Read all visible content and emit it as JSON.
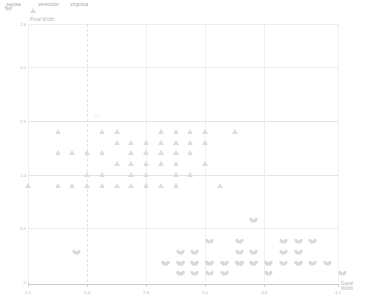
{
  "chart_data": {
    "type": "scatter",
    "title": "",
    "xlabel": "Sepal Width",
    "ylabel": "Petal Width",
    "xlim": [
      2.0,
      4.1
    ],
    "ylim": [
      0,
      2.4
    ],
    "grid": true,
    "legend_position": "top-left",
    "xticks": [
      "2.0",
      "2.4",
      "2.8",
      "3.2",
      "3.6",
      "4.1"
    ],
    "yticks": [
      "0",
      "0.5",
      "1.0",
      "1.5",
      "2.0",
      "2.4"
    ],
    "annotation": "1.5",
    "series": [
      {
        "name": "setosa",
        "marker": "heart-marker",
        "color": "#d8d8e2",
        "points": [
          [
            2.3,
            0.3
          ],
          [
            2.9,
            0.2
          ],
          [
            3.0,
            0.2
          ],
          [
            3.0,
            0.1
          ],
          [
            3.0,
            0.2
          ],
          [
            3.1,
            0.2
          ],
          [
            3.1,
            0.1
          ],
          [
            3.1,
            0.2
          ],
          [
            3.2,
            0.2
          ],
          [
            3.2,
            0.2
          ],
          [
            3.3,
            0.1
          ],
          [
            3.4,
            0.2
          ],
          [
            3.4,
            0.2
          ],
          [
            3.4,
            0.4
          ],
          [
            3.4,
            0.2
          ],
          [
            3.5,
            0.2
          ],
          [
            3.5,
            0.2
          ],
          [
            3.5,
            0.6
          ],
          [
            3.6,
            0.1
          ],
          [
            3.6,
            0.2
          ],
          [
            3.7,
            0.2
          ],
          [
            3.7,
            0.4
          ],
          [
            3.8,
            0.2
          ],
          [
            3.8,
            0.3
          ],
          [
            3.8,
            0.2
          ],
          [
            3.9,
            0.4
          ],
          [
            3.9,
            0.2
          ],
          [
            4.0,
            0.2
          ],
          [
            4.1,
            0.1
          ],
          [
            4.2,
            0.2
          ],
          [
            4.4,
            0.2
          ],
          [
            3.0,
            0.2
          ],
          [
            3.2,
            0.2
          ],
          [
            3.4,
            0.2
          ],
          [
            3.5,
            0.2
          ],
          [
            3.1,
            0.2
          ],
          [
            3.0,
            0.1
          ],
          [
            3.2,
            0.1
          ],
          [
            3.3,
            0.2
          ],
          [
            3.4,
            0.2
          ],
          [
            2.9,
            0.2
          ],
          [
            3.0,
            0.3
          ],
          [
            3.1,
            0.3
          ],
          [
            3.2,
            0.4
          ],
          [
            3.6,
            0.2
          ],
          [
            3.5,
            0.3
          ],
          [
            3.4,
            0.3
          ],
          [
            3.3,
            0.2
          ],
          [
            3.7,
            0.3
          ],
          [
            3.8,
            0.4
          ]
        ]
      },
      {
        "name": "versicolor",
        "marker": "triangle-marker",
        "color": "#dcdce4",
        "points": [
          [
            2.0,
            1.0
          ],
          [
            2.2,
            1.0
          ],
          [
            2.2,
            1.3
          ],
          [
            2.3,
            1.3
          ],
          [
            2.4,
            1.0
          ],
          [
            2.4,
            1.1
          ],
          [
            2.4,
            1.3
          ],
          [
            2.5,
            1.0
          ],
          [
            2.5,
            1.1
          ],
          [
            2.5,
            1.3
          ],
          [
            2.6,
            1.0
          ],
          [
            2.6,
            1.2
          ],
          [
            2.6,
            1.4
          ],
          [
            2.7,
            1.0
          ],
          [
            2.7,
            1.2
          ],
          [
            2.7,
            1.3
          ],
          [
            2.7,
            1.4
          ],
          [
            2.8,
            1.0
          ],
          [
            2.8,
            1.2
          ],
          [
            2.8,
            1.3
          ],
          [
            2.8,
            1.3
          ],
          [
            2.8,
            1.4
          ],
          [
            2.9,
            1.0
          ],
          [
            2.9,
            1.3
          ],
          [
            2.9,
            1.3
          ],
          [
            2.9,
            1.4
          ],
          [
            2.9,
            1.5
          ],
          [
            3.0,
            1.0
          ],
          [
            3.0,
            1.1
          ],
          [
            3.0,
            1.3
          ],
          [
            3.0,
            1.3
          ],
          [
            3.0,
            1.4
          ],
          [
            3.0,
            1.5
          ],
          [
            3.1,
            1.1
          ],
          [
            3.1,
            1.5
          ],
          [
            3.2,
            1.2
          ],
          [
            3.2,
            1.4
          ],
          [
            3.2,
            1.5
          ],
          [
            3.3,
            1.0
          ],
          [
            3.4,
            1.5
          ],
          [
            2.3,
            1.0
          ],
          [
            2.5,
            1.5
          ],
          [
            2.6,
            1.5
          ],
          [
            2.7,
            1.1
          ],
          [
            2.8,
            1.1
          ],
          [
            2.9,
            1.2
          ],
          [
            3.0,
            1.2
          ],
          [
            3.1,
            1.3
          ],
          [
            3.1,
            1.4
          ],
          [
            2.2,
            1.5
          ]
        ]
      },
      {
        "name": "virginica",
        "marker": "diamond-marker",
        "color": "#c8c8d4",
        "points": [
          [
            2.2,
            1.5
          ],
          [
            2.5,
            1.5
          ],
          [
            2.5,
            1.7
          ],
          [
            2.5,
            1.8
          ],
          [
            2.5,
            1.9
          ],
          [
            2.6,
            1.4
          ],
          [
            2.6,
            1.8
          ],
          [
            2.7,
            1.8
          ],
          [
            2.7,
            1.8
          ],
          [
            2.7,
            1.9
          ],
          [
            2.7,
            1.9
          ],
          [
            2.8,
            1.5
          ],
          [
            2.8,
            1.8
          ],
          [
            2.8,
            1.8
          ],
          [
            2.8,
            2.0
          ],
          [
            2.8,
            2.1
          ],
          [
            2.8,
            2.2
          ],
          [
            2.9,
            1.8
          ],
          [
            2.9,
            2.1
          ],
          [
            2.9,
            2.3
          ],
          [
            3.0,
            1.5
          ],
          [
            3.0,
            1.6
          ],
          [
            3.0,
            1.8
          ],
          [
            3.0,
            1.8
          ],
          [
            3.0,
            1.8
          ],
          [
            3.0,
            1.9
          ],
          [
            3.0,
            2.1
          ],
          [
            3.0,
            2.1
          ],
          [
            3.0,
            2.1
          ],
          [
            3.0,
            2.3
          ],
          [
            3.1,
            1.5
          ],
          [
            3.1,
            1.8
          ],
          [
            3.1,
            2.0
          ],
          [
            3.1,
            2.1
          ],
          [
            3.1,
            2.3
          ],
          [
            3.2,
            1.8
          ],
          [
            3.2,
            1.9
          ],
          [
            3.2,
            2.0
          ],
          [
            3.2,
            2.3
          ],
          [
            3.2,
            2.3
          ],
          [
            3.3,
            2.1
          ],
          [
            3.3,
            2.5
          ],
          [
            3.4,
            1.6
          ],
          [
            3.4,
            2.3
          ],
          [
            3.6,
            2.5
          ],
          [
            3.8,
            2.0
          ],
          [
            3.8,
            2.2
          ],
          [
            2.8,
            2.4
          ],
          [
            3.0,
            2.4
          ],
          [
            3.3,
            1.7
          ]
        ]
      }
    ]
  }
}
